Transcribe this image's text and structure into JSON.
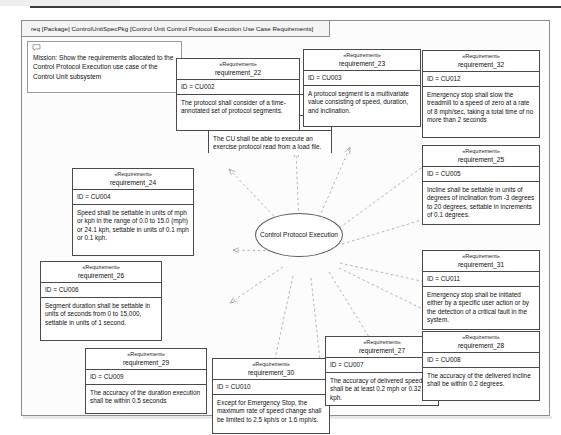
{
  "frame": {
    "header": "req [Package] ControlUnitSpecPkg [Control Unit Control Protocol Execution Use Case Requirements]"
  },
  "note": {
    "icon": "comment-icon",
    "text": "Mission: Show the requirements allocated to the Control Protocol Execution use case of the Control Unit subsystem"
  },
  "usecase": {
    "name": "Control Protocol Execution"
  },
  "stereotype": "«Requirement»",
  "requirements": [
    {
      "name": "requirement_21",
      "id": "ID = CU001",
      "text": "The CU shall be able to execute an exercise protocol read from a load file."
    },
    {
      "name": "requirement_22",
      "id": "ID = CU002",
      "text": "The protocol shall consider of a time-annotated set of protocol segments."
    },
    {
      "name": "requirement_23",
      "id": "ID = CU003",
      "text": "A protocol segment is a multivariate value consisting of speed, duration, and inclination."
    },
    {
      "name": "requirement_32",
      "id": "ID = CU012",
      "text": "Emergency stop shall slow the treadmill to a speed of zero at a rate of 8 mph/sec, taking a total time of no more than 2 seconds"
    },
    {
      "name": "requirement_25",
      "id": "ID = CU005",
      "text": "Incline shall be settable in units of degrees of inclination from -3 degrees to 20 degrees, settable in increments of 0.1 degrees."
    },
    {
      "name": "requirement_24",
      "id": "ID = CU004",
      "text": "Speed shall be settable in units of mph or kph in the range of 0.0 to 15.0 (mph) or 24.1 kph, settable in units of 0.1 mph or 0.1 kph."
    },
    {
      "name": "requirement_31",
      "id": "ID = CU011",
      "text": "Emergency stop shall be initiated either by a specific user action or by the detection of a critical fault in the system."
    },
    {
      "name": "requirement_26",
      "id": "ID = CU006",
      "text": "Segment duration shall be settable in units of seconds from 0 to 15,000, settable in units of 1 second."
    },
    {
      "name": "requirement_29",
      "id": "ID = CU009",
      "text": "The accuracy of the duration execution shall be within 0.5 seconds"
    },
    {
      "name": "requirement_30",
      "id": "ID = CU010",
      "text": "Except for Emergency Stop, the maximum rate of speed change shall be limited to 2.5 kph/s or 1.6 mph/s."
    },
    {
      "name": "requirement_27",
      "id": "ID = CU007",
      "text": "The accuracy of delivered speed shall be at least 0.2 mph or 0.32 kph."
    },
    {
      "name": "requirement_28",
      "id": "ID = CU008",
      "text": "The accuracy of the delivered incline shall be within 0.2 degrees."
    }
  ]
}
